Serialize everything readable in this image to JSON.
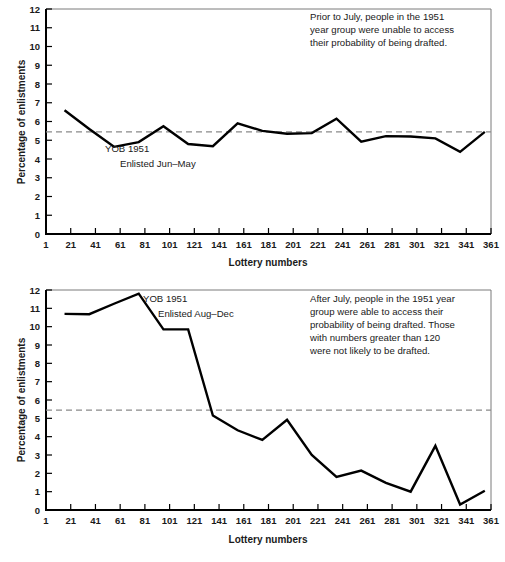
{
  "figure": {
    "background": "#ffffff",
    "line_color": "#000000",
    "reference_line_color": "#8a8a8a"
  },
  "chart_data": [
    {
      "id": "top",
      "type": "line",
      "title": "",
      "xlabel": "Lottery numbers",
      "ylabel": "Percentage of enlistments",
      "xlim": [
        1,
        361
      ],
      "ylim": [
        0,
        12
      ],
      "grid": false,
      "legend": "none",
      "xticks": [
        1,
        21,
        41,
        61,
        81,
        101,
        121,
        141,
        161,
        181,
        201,
        221,
        241,
        261,
        281,
        301,
        321,
        341,
        361
      ],
      "yticks": [
        0,
        1,
        2,
        3,
        4,
        5,
        6,
        7,
        8,
        9,
        10,
        11,
        12
      ],
      "reference_line": {
        "y": 5.45,
        "style": "dashed"
      },
      "series": [
        {
          "name": "YOB 1951 Enlisted Jun–May",
          "x": [
            16,
            36,
            56,
            76,
            96,
            116,
            136,
            156,
            176,
            196,
            216,
            236,
            256,
            276,
            296,
            316,
            336,
            356
          ],
          "values": [
            6.6,
            5.6,
            4.65,
            4.9,
            5.75,
            4.8,
            4.68,
            5.9,
            5.5,
            5.35,
            5.38,
            6.15,
            4.92,
            5.22,
            5.2,
            5.1,
            4.38,
            5.45
          ]
        }
      ],
      "annotation": "Prior to July, people in the 1951 year group were unable to access their probability of being drafted.",
      "annotation_lines": [
        "Prior to July, people in the 1951",
        "year group were unable to access",
        "their probability of being drafted."
      ],
      "series_label_lines": [
        "YOB 1951",
        "Enlisted Jun–May"
      ]
    },
    {
      "id": "bottom",
      "type": "line",
      "title": "",
      "xlabel": "Lottery numbers",
      "ylabel": "Percentage of enlistments",
      "xlim": [
        1,
        361
      ],
      "ylim": [
        0,
        12
      ],
      "grid": false,
      "legend": "none",
      "xticks": [
        1,
        21,
        41,
        61,
        81,
        101,
        121,
        141,
        161,
        181,
        201,
        221,
        241,
        261,
        281,
        301,
        321,
        341,
        361
      ],
      "yticks": [
        0,
        1,
        2,
        3,
        4,
        5,
        6,
        7,
        8,
        9,
        10,
        11,
        12
      ],
      "reference_line": {
        "y": 5.45,
        "style": "dashed"
      },
      "series": [
        {
          "name": "YOB 1951 Enlisted Aug–Dec",
          "x": [
            16,
            36,
            56,
            76,
            96,
            116,
            136,
            156,
            176,
            196,
            216,
            236,
            256,
            276,
            296,
            316,
            336,
            356
          ],
          "values": [
            10.7,
            10.68,
            11.25,
            11.8,
            9.85,
            9.85,
            5.15,
            4.35,
            3.82,
            4.92,
            3.0,
            1.8,
            2.15,
            1.48,
            1.0,
            3.5,
            0.3,
            1.05
          ]
        }
      ],
      "annotation": "After July, people in the 1951 year group were able to access their probability of being drafted. Those with numbers greater than 120 were not likely to be drafted.",
      "annotation_lines": [
        "After July, people in the 1951 year",
        "group were able to access their",
        "probability of being drafted. Those",
        "with numbers greater than 120",
        "were not likely to be drafted."
      ],
      "series_label_lines": [
        "YOB 1951",
        "Enlisted Aug–Dec"
      ]
    }
  ]
}
